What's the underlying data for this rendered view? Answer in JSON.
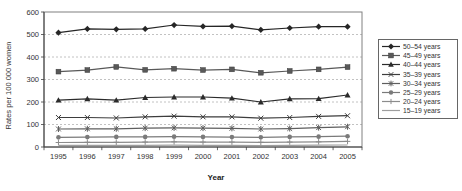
{
  "figure": {
    "title": "",
    "background": "#ffffff"
  },
  "chart_data": {
    "type": "line",
    "categories": [
      "1995",
      "1996",
      "1997",
      "1998",
      "1999",
      "2000",
      "2001",
      "2002",
      "2003",
      "2004",
      "2005"
    ],
    "xlabel": "Year",
    "ylabel": "Rates per 100 000 women",
    "ylim": [
      0,
      600
    ],
    "yticks": [
      0,
      100,
      200,
      300,
      400,
      500,
      600
    ],
    "grid": "horizontal dashed gridlines at 100-500",
    "legend_position": "right",
    "axis_color": "#404040",
    "gridline_color": "#b3b3b3",
    "series": [
      {
        "name": "50–54 years",
        "marker": "diamond",
        "color": "#262626",
        "values": [
          508,
          525,
          523,
          525,
          542,
          536,
          537,
          521,
          529,
          535,
          535
        ]
      },
      {
        "name": "45–49 years",
        "marker": "square",
        "color": "#595959",
        "values": [
          335,
          342,
          356,
          343,
          348,
          342,
          345,
          330,
          338,
          345,
          355
        ]
      },
      {
        "name": "40–44 years",
        "marker": "triangle",
        "color": "#2b2b2b",
        "values": [
          208,
          214,
          208,
          220,
          222,
          222,
          217,
          200,
          214,
          215,
          231
        ]
      },
      {
        "name": "35–39 years",
        "marker": "x",
        "color": "#3d3d3d",
        "values": [
          131,
          131,
          129,
          134,
          137,
          134,
          134,
          128,
          131,
          136,
          139
        ]
      },
      {
        "name": "30–34 years",
        "marker": "star",
        "color": "#5e5e5e",
        "values": [
          80,
          81,
          81,
          84,
          85,
          84,
          83,
          80,
          82,
          86,
          90
        ]
      },
      {
        "name": "25–29 years",
        "marker": "circle",
        "color": "#7a7a7a",
        "values": [
          43,
          44,
          45,
          45,
          46,
          45,
          44,
          43,
          45,
          46,
          48
        ]
      },
      {
        "name": "20–24 years",
        "marker": "plus",
        "color": "#8c8c8c",
        "values": [
          20,
          21,
          21,
          22,
          23,
          22,
          22,
          21,
          22,
          23,
          25
        ]
      },
      {
        "name": "15–19 years",
        "marker": "none",
        "color": "#9e9e9e",
        "values": [
          7,
          7,
          7,
          7,
          8,
          7,
          7,
          6,
          7,
          8,
          9
        ]
      }
    ]
  }
}
